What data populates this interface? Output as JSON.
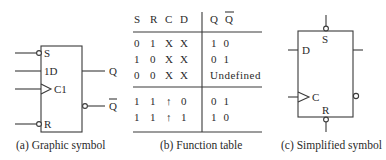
{
  "panel_a": {
    "caption": "(a) Graphic symbol",
    "inputs": {
      "s": "S",
      "d": "1D",
      "c": "C1",
      "r": "R"
    },
    "outputs": {
      "q": "Q",
      "qbar": "Q"
    }
  },
  "panel_b": {
    "caption": "(b) Function table",
    "headers": {
      "s": "S",
      "r": "R",
      "c": "C",
      "d": "D",
      "q": "Q",
      "qbar": "Q"
    },
    "rows": [
      {
        "s": "0",
        "r": "1",
        "c": "X",
        "d": "X",
        "out": "1  0"
      },
      {
        "s": "1",
        "r": "0",
        "c": "X",
        "d": "X",
        "out": "0  1"
      },
      {
        "s": "0",
        "r": "0",
        "c": "X",
        "d": "X",
        "out": "Undefined"
      },
      {
        "s": "1",
        "r": "1",
        "c": "↑",
        "d": "0",
        "out": "0  1"
      },
      {
        "s": "1",
        "r": "1",
        "c": "↑",
        "d": "1",
        "out": "1  0"
      }
    ]
  },
  "panel_c": {
    "caption": "(c) Simplified symbol",
    "inputs": {
      "s": "S",
      "d": "D",
      "c": "C",
      "r": "R"
    }
  }
}
